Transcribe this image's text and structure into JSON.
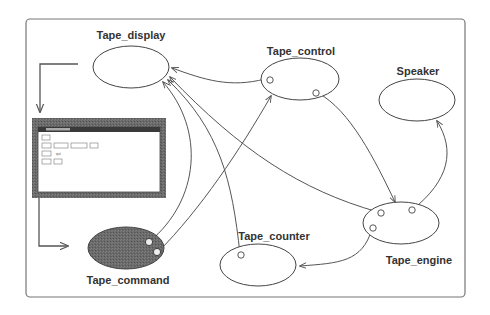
{
  "diagram": {
    "type": "component-graph",
    "colors": {
      "frame": "#666666",
      "edge": "#555555",
      "node_stroke": "#444444",
      "filled_node": "#666666",
      "window_frame": "#808080"
    },
    "nodes": [
      {
        "id": "tape_display",
        "label": "Tape_display",
        "filled": false
      },
      {
        "id": "tape_control",
        "label": "Tape_control",
        "filled": false
      },
      {
        "id": "speaker",
        "label": "Speaker",
        "filled": false
      },
      {
        "id": "tape_engine",
        "label": "Tape_engine",
        "filled": false
      },
      {
        "id": "tape_counter",
        "label": "Tape_counter",
        "filled": false
      },
      {
        "id": "tape_command",
        "label": "Tape_command",
        "filled": true
      }
    ],
    "edges": [
      {
        "from": "tape_control",
        "to": "tape_display"
      },
      {
        "from": "tape_command",
        "to": "tape_display"
      },
      {
        "from": "tape_command",
        "to": "tape_control"
      },
      {
        "from": "tape_counter",
        "to": "tape_display"
      },
      {
        "from": "tape_engine",
        "to": "tape_display"
      },
      {
        "from": "tape_control",
        "to": "tape_engine"
      },
      {
        "from": "tape_engine",
        "to": "speaker"
      },
      {
        "from": "tape_engine",
        "to": "tape_counter"
      }
    ],
    "embedded_window": {
      "description": "Tape_command user interface window (labels illegible at this resolution)",
      "rows": [
        [
          "quit"
        ],
        [
          "play",
          "forward",
          "backward",
          "stop"
        ],
        [
          "rewd",
          "quit"
        ],
        [
          "eject",
          "load"
        ]
      ]
    }
  }
}
